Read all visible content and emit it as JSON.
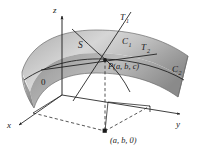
{
  "figure": {
    "type": "3d-surface-tangent-plane-diagram",
    "background_color": "#ffffff",
    "ink_color": "#1a1a1a",
    "surface_fill_light": "#e8e8e8",
    "surface_fill_mid": "#b8b8b8",
    "surface_fill_dark": "#8f8f8f",
    "surface_edge_color": "#555555"
  },
  "axes": {
    "z": {
      "label": "z",
      "arrow": "up"
    },
    "x": {
      "label": "x",
      "arrow": "down-left"
    },
    "y": {
      "label": "y",
      "arrow": "right"
    },
    "origin": {
      "label": "0"
    }
  },
  "labels": {
    "surface": "S",
    "curve_1": "C",
    "curve_1_sub": "1",
    "curve_2": "C",
    "curve_2_sub": "2",
    "tangent_1": "T",
    "tangent_1_sub": "1",
    "tangent_2": "T",
    "tangent_2_sub": "2",
    "point_on_surface": "P(a, b, c)",
    "point_in_plane": "(a, b, 0)"
  }
}
